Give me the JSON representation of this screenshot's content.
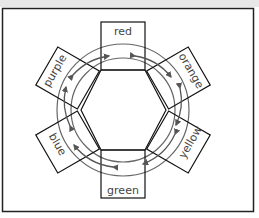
{
  "diagram": {
    "title": "",
    "type": "color-wheel-hexagon",
    "segments": [
      {
        "id": "red",
        "label": "red",
        "angle": 0
      },
      {
        "id": "orange",
        "label": "orange",
        "angle": 60
      },
      {
        "id": "yellow",
        "label": "yellow",
        "angle": 120
      },
      {
        "id": "green",
        "label": "green",
        "angle": 180
      },
      {
        "id": "blue",
        "label": "blue",
        "angle": 240
      },
      {
        "id": "purple",
        "label": "purple",
        "angle": 300
      }
    ],
    "arrows": "bidirectional arcs between adjacent color boxes",
    "colors": {
      "stroke": "#111111",
      "arrow": "#555555",
      "circle": "#666666",
      "frame": "#222222"
    }
  }
}
